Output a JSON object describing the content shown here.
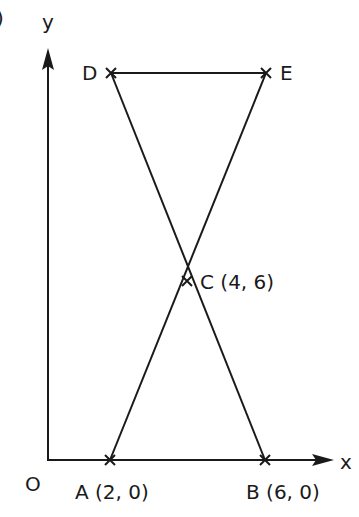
{
  "figure": {
    "part_marker": ")",
    "axes": {
      "x_label": "x",
      "y_label": "y",
      "origin_label": "O"
    },
    "points": [
      {
        "name": "A",
        "label": "A (2, 0)",
        "x": 2,
        "y": 0
      },
      {
        "name": "B",
        "label": "B (6, 0)",
        "x": 6,
        "y": 0
      },
      {
        "name": "C",
        "label": "C (4, 6)",
        "x": 4,
        "y": 6
      },
      {
        "name": "D",
        "label": "D",
        "x": 2,
        "y": 12
      },
      {
        "name": "E",
        "label": "E",
        "x": 6,
        "y": 12
      }
    ],
    "segments": [
      {
        "from": "D",
        "to": "E"
      },
      {
        "from": "D",
        "to": "B"
      },
      {
        "from": "E",
        "to": "A"
      }
    ],
    "line_color": "#1a1a1a"
  }
}
